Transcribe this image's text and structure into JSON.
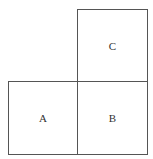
{
  "diagram": {
    "boxes": [
      {
        "id": "A",
        "label": "A",
        "position": "bottom-left"
      },
      {
        "id": "B",
        "label": "B",
        "position": "bottom-right"
      },
      {
        "id": "C",
        "label": "C",
        "position": "top-right"
      }
    ],
    "colors": {
      "border": "#555555",
      "text": "#333333",
      "background": "#ffffff"
    }
  }
}
